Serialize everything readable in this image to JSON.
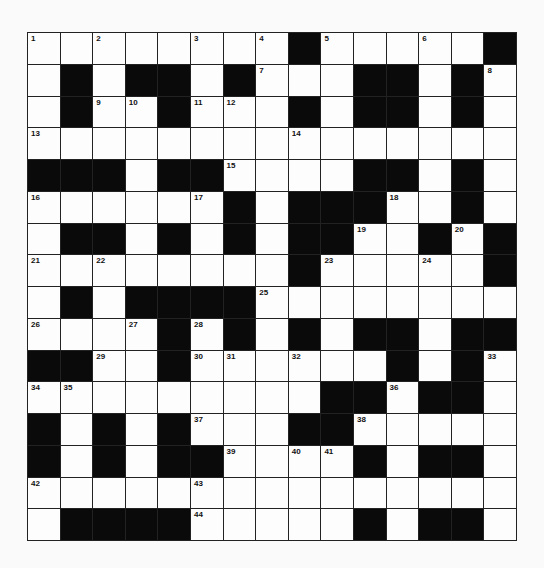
{
  "puzzle": {
    "cols": 15,
    "rows": 16,
    "colors": {
      "block": "#0a0a0a",
      "cell": "#fdfdfd",
      "line": "#222222"
    },
    "grid": [
      [
        "1",
        ".",
        "2",
        ".",
        ".",
        "3",
        ".",
        "4",
        "#",
        "5",
        ".",
        ".",
        "6",
        ".",
        "#"
      ],
      [
        ".",
        "#",
        ".",
        "#",
        "#",
        ".",
        "#",
        "7",
        ".",
        ".",
        "#",
        "#",
        ".",
        "#",
        "8"
      ],
      [
        ".",
        "#",
        "9",
        "10",
        "#",
        "11",
        "12",
        ".",
        "#",
        ".",
        "#",
        "#",
        ".",
        "#",
        "."
      ],
      [
        "13",
        ".",
        ".",
        ".",
        ".",
        ".",
        ".",
        ".",
        "14",
        ".",
        ".",
        ".",
        ".",
        ".",
        "."
      ],
      [
        "#",
        "#",
        "#",
        ".",
        "#",
        "#",
        "15",
        ".",
        ".",
        ".",
        "#",
        "#",
        ".",
        "#",
        "."
      ],
      [
        "16",
        ".",
        ".",
        ".",
        ".",
        "17",
        "#",
        ".",
        "#",
        "#",
        "#",
        "18",
        ".",
        "#",
        "."
      ],
      [
        ".",
        "#",
        "#",
        ".",
        "#",
        ".",
        "#",
        ".",
        "#",
        "#",
        "19",
        ".",
        "#",
        "20",
        "#"
      ],
      [
        "21",
        ".",
        "22",
        ".",
        ".",
        ".",
        ".",
        ".",
        "#",
        "23",
        ".",
        ".",
        "24",
        ".",
        "#"
      ],
      [
        ".",
        "#",
        ".",
        "#",
        "#",
        "#",
        "#",
        "25",
        ".",
        ".",
        ".",
        ".",
        ".",
        ".",
        "."
      ],
      [
        "26",
        ".",
        ".",
        "27",
        "#",
        "28",
        "#",
        ".",
        "#",
        ".",
        "#",
        "#",
        ".",
        "#",
        "#"
      ],
      [
        "#",
        "#",
        "29",
        ".",
        "#",
        "30",
        "31",
        ".",
        "32",
        ".",
        ".",
        "#",
        ".",
        "#",
        "33"
      ],
      [
        "34",
        "35",
        ".",
        ".",
        ".",
        ".",
        ".",
        ".",
        ".",
        "#",
        "#",
        "36",
        "#",
        "#",
        "."
      ],
      [
        "#",
        ".",
        "#",
        ".",
        "#",
        "37",
        ".",
        ".",
        "#",
        "#",
        "38",
        ".",
        ".",
        ".",
        "."
      ],
      [
        "#",
        ".",
        "#",
        ".",
        "#",
        "#",
        "39",
        ".",
        "40",
        "41",
        "#",
        ".",
        "#",
        "#",
        "."
      ],
      [
        "42",
        ".",
        ".",
        ".",
        ".",
        "43",
        ".",
        ".",
        ".",
        ".",
        ".",
        ".",
        ".",
        ".",
        "."
      ],
      [
        ".",
        "#",
        "#",
        "#",
        "#",
        "44",
        ".",
        ".",
        ".",
        ".",
        "#",
        ".",
        "#",
        "#",
        "."
      ]
    ]
  }
}
